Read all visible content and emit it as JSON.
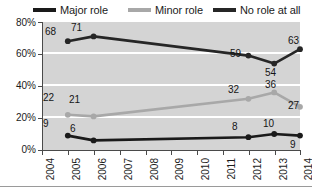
{
  "chart_data": {
    "type": "line",
    "title": "",
    "xlabel": "",
    "ylabel": "",
    "x": [
      2004,
      2005,
      2006,
      2007,
      2008,
      2009,
      2010,
      2011,
      2012,
      2013,
      2014
    ],
    "categories": [
      "2004",
      "2005",
      "2006",
      "2007",
      "2008",
      "2009",
      "2010",
      "2011",
      "2012",
      "2013",
      "2014"
    ],
    "ylim": [
      0,
      80
    ],
    "yticks": [
      0,
      20,
      40,
      60,
      80
    ],
    "ytick_labels": [
      "0%",
      "20%",
      "40%",
      "60%",
      "80%"
    ],
    "grid": true,
    "grid_axis": "y",
    "legend_position": "top",
    "series": [
      {
        "name": "Major role",
        "color": "#1a1a1a",
        "points": [
          {
            "x": 2005,
            "y": 9,
            "label": "9"
          },
          {
            "x": 2006,
            "y": 6,
            "label": "6"
          },
          {
            "x": 2012,
            "y": 8,
            "label": "8"
          },
          {
            "x": 2013,
            "y": 10,
            "label": "10"
          },
          {
            "x": 2014,
            "y": 9,
            "label": "9"
          }
        ]
      },
      {
        "name": "Minor role",
        "color": "#a8a8a8",
        "points": [
          {
            "x": 2005,
            "y": 22,
            "label": "22"
          },
          {
            "x": 2006,
            "y": 21,
            "label": "21"
          },
          {
            "x": 2012,
            "y": 32,
            "label": "32"
          },
          {
            "x": 2013,
            "y": 36,
            "label": "36"
          },
          {
            "x": 2014,
            "y": 27,
            "label": "27"
          }
        ]
      },
      {
        "name": "No role at all",
        "color": "#262626",
        "points": [
          {
            "x": 2005,
            "y": 68,
            "label": "68"
          },
          {
            "x": 2006,
            "y": 71,
            "label": "71"
          },
          {
            "x": 2012,
            "y": 59,
            "label": "59"
          },
          {
            "x": 2013,
            "y": 54,
            "label": "54"
          },
          {
            "x": 2014,
            "y": 63,
            "label": "63"
          }
        ]
      }
    ]
  },
  "legend": {
    "items": [
      {
        "label": "Major role",
        "color": "#1a1a1a"
      },
      {
        "label": "Minor role",
        "color": "#a8a8a8"
      },
      {
        "label": "No role at all",
        "color": "#262626"
      }
    ]
  },
  "axes": {
    "y_labels": [
      "80%",
      "60%",
      "40%",
      "20%",
      "0%"
    ],
    "x_labels": [
      "2004",
      "2005",
      "2006",
      "2007",
      "2008",
      "2009",
      "2010",
      "2011",
      "2012",
      "2013",
      "2014"
    ]
  },
  "value_labels": [
    {
      "text": "68",
      "x": 45,
      "y": 27,
      "name": "value-label-norole-2005"
    },
    {
      "text": "71",
      "x": 71,
      "y": 23,
      "name": "value-label-norole-2006"
    },
    {
      "text": "59",
      "x": 230,
      "y": 49,
      "name": "value-label-norole-2012"
    },
    {
      "text": "54",
      "x": 265,
      "y": 68,
      "name": "value-label-norole-2013"
    },
    {
      "text": "63",
      "x": 288,
      "y": 36,
      "name": "value-label-norole-2014"
    },
    {
      "text": "22",
      "x": 43,
      "y": 93,
      "name": "value-label-minor-2005"
    },
    {
      "text": "21",
      "x": 69,
      "y": 95,
      "name": "value-label-minor-2006"
    },
    {
      "text": "32",
      "x": 228,
      "y": 85,
      "name": "value-label-minor-2012"
    },
    {
      "text": "36",
      "x": 265,
      "y": 80,
      "name": "value-label-minor-2013"
    },
    {
      "text": "27",
      "x": 288,
      "y": 101,
      "name": "value-label-minor-2014"
    },
    {
      "text": "9",
      "x": 43,
      "y": 119,
      "name": "value-label-major-2005"
    },
    {
      "text": "6",
      "x": 70,
      "y": 124,
      "name": "value-label-major-2006"
    },
    {
      "text": "8",
      "x": 232,
      "y": 122,
      "name": "value-label-major-2012"
    },
    {
      "text": "10",
      "x": 263,
      "y": 119,
      "name": "value-label-major-2013"
    },
    {
      "text": "9",
      "x": 290,
      "y": 140,
      "name": "value-label-major-2014"
    }
  ]
}
